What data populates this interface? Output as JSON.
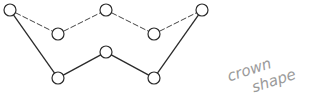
{
  "diagram": {
    "caption_line1": "crown",
    "caption_line2": "shape",
    "nodes": [
      {
        "id": "A",
        "x": 10,
        "y": 10
      },
      {
        "id": "B",
        "x": 58,
        "y": 34
      },
      {
        "id": "C",
        "x": 106,
        "y": 10
      },
      {
        "id": "D",
        "x": 154,
        "y": 34
      },
      {
        "id": "E",
        "x": 202,
        "y": 10
      },
      {
        "id": "F",
        "x": 58,
        "y": 78
      },
      {
        "id": "G",
        "x": 106,
        "y": 52
      },
      {
        "id": "H",
        "x": 154,
        "y": 78
      }
    ],
    "dashed_edges": [
      [
        "A",
        "B"
      ],
      [
        "B",
        "C"
      ],
      [
        "C",
        "D"
      ],
      [
        "D",
        "E"
      ]
    ],
    "solid_edges": [
      [
        "A",
        "F"
      ],
      [
        "F",
        "G"
      ],
      [
        "G",
        "H"
      ],
      [
        "H",
        "E"
      ]
    ],
    "node_radius": 6,
    "colors": {
      "stroke": "#2a2a2a",
      "caption": "#9a9a9a"
    }
  }
}
